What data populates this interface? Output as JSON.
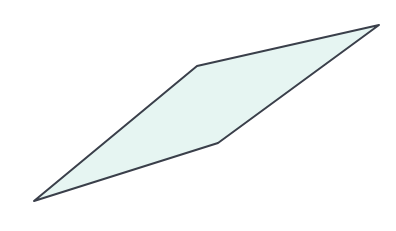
{
  "diagram": {
    "type": "polygon",
    "shape": "quadrilateral",
    "fill_color": "#e6f5f2",
    "stroke_color": "#3a3f4a",
    "stroke_width": 2,
    "vertices": [
      {
        "x": 34,
        "y": 201
      },
      {
        "x": 197,
        "y": 66
      },
      {
        "x": 379,
        "y": 25
      },
      {
        "x": 218,
        "y": 143
      }
    ],
    "points_attr": "34,201 197,66 379,25 218,143"
  }
}
